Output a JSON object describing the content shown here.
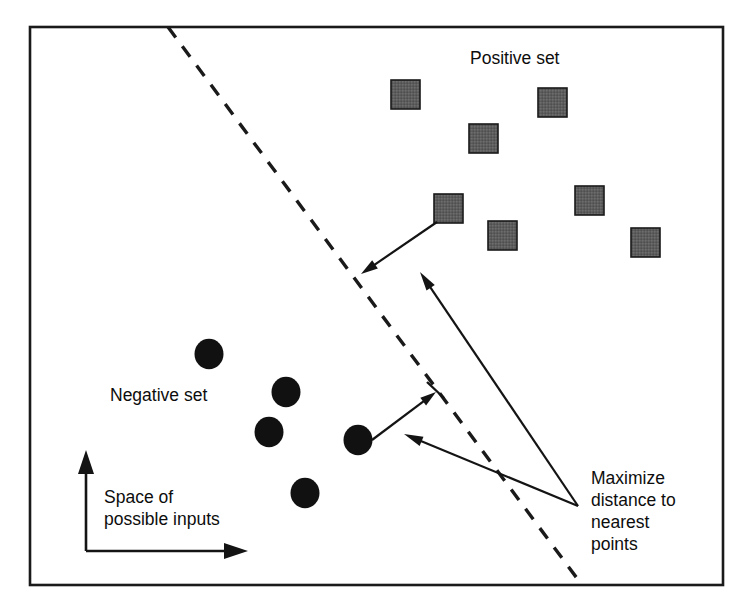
{
  "figure": {
    "width": 746,
    "height": 611,
    "background_color": "#ffffff",
    "frame": {
      "x": 30,
      "y": 27,
      "width": 693,
      "height": 558,
      "stroke_color": "#1a1a1a",
      "stroke_width": 2.6
    }
  },
  "labels": {
    "positive_set": {
      "text": "Positive set",
      "x": 470,
      "y": 64
    },
    "negative_set": {
      "text": "Negative set",
      "x": 110,
      "y": 401
    },
    "space_of_line1": {
      "text": "Space of",
      "x": 104,
      "y": 503
    },
    "space_of_line2": {
      "text": "possible inputs",
      "x": 104,
      "y": 525
    },
    "maximize_line1": {
      "text": "Maximize",
      "x": 591,
      "y": 484
    },
    "maximize_line2": {
      "text": "distance to",
      "x": 591,
      "y": 506
    },
    "maximize_line3": {
      "text": "nearest",
      "x": 591,
      "y": 528
    },
    "maximize_line4": {
      "text": "points",
      "x": 591,
      "y": 550
    }
  },
  "decision_boundary": {
    "name": "dashed-decision-boundary",
    "x1": 168,
    "y1": 27,
    "x2": 582,
    "y2": 585,
    "dash_pattern": "13 11",
    "stroke_color": "#1a1a1a",
    "stroke_width": 3.4
  },
  "chart_data": {
    "type": "scatter",
    "xlabel": "Space of possible inputs",
    "ylabel": "",
    "grid": false,
    "legend_position": "in-plot",
    "series": [
      {
        "name": "Positive set",
        "marker": "square",
        "fill_color": "#595959",
        "stroke_color": "#1a1a1a",
        "size": 29,
        "points": [
          {
            "x": 391,
            "y": 80
          },
          {
            "x": 538,
            "y": 88
          },
          {
            "x": 469,
            "y": 124
          },
          {
            "x": 575,
            "y": 186
          },
          {
            "x": 434,
            "y": 194
          },
          {
            "x": 488,
            "y": 221
          },
          {
            "x": 631,
            "y": 228
          }
        ]
      },
      {
        "name": "Negative set",
        "marker": "circle",
        "fill_color": "#111111",
        "stroke_color": "none",
        "size": 29,
        "points": [
          {
            "x": 209,
            "y": 354
          },
          {
            "x": 286,
            "y": 392
          },
          {
            "x": 269,
            "y": 432
          },
          {
            "x": 358,
            "y": 440
          },
          {
            "x": 305,
            "y": 493
          }
        ]
      }
    ]
  },
  "annotations": {
    "margin_arrow_positive": {
      "name": "margin-arrow-positive",
      "from_x": 437,
      "from_y": 222,
      "to_x": 361,
      "to_y": 274,
      "description": "Arrow from nearest positive square to the decision boundary"
    },
    "margin_arrow_negative": {
      "name": "margin-arrow-negative",
      "from_x": 372,
      "from_y": 440,
      "to_x": 436,
      "to_y": 392,
      "description": "Arrow from nearest negative circle to the decision boundary"
    },
    "callout_upper": {
      "name": "callout-arrow-upper",
      "from_x": 578,
      "from_y": 506,
      "to_x": 420,
      "to_y": 272,
      "description": "Callout from Maximize label to the positive margin"
    },
    "callout_lower": {
      "name": "callout-arrow-lower",
      "from_x": 578,
      "from_y": 506,
      "to_x": 404,
      "to_y": 434,
      "description": "Callout from Maximize label to the negative margin"
    },
    "tick_mark": {
      "name": "margin-tick-mark",
      "x1": 427,
      "y1": 382,
      "x2": 444,
      "y2": 398
    }
  },
  "axes": {
    "origin_x": 86,
    "origin_y": 551,
    "vertical_tip_y": 450,
    "horizontal_tip_x": 248,
    "stroke_color": "#141414"
  },
  "colors": {
    "ink": "#1a1a1a",
    "square_fill": "#595959",
    "circle_fill": "#111111",
    "page_background": "#ffffff"
  }
}
